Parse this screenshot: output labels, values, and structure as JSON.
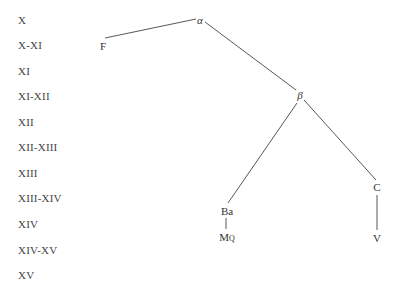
{
  "timeline": {
    "labels": [
      "X",
      "X-XI",
      "XI",
      "XI-XII",
      "XII",
      "XII-XIII",
      "XIII",
      "XIII-XIV",
      "XIV",
      "XIV-XV",
      "XV"
    ]
  },
  "stemma": {
    "nodes": {
      "alpha": {
        "label": "α"
      },
      "beta": {
        "label": "β"
      },
      "F": {
        "label": "F"
      },
      "Ba": {
        "label": "Ba"
      },
      "MQ": {
        "label_main": "M",
        "label_sub": "Q"
      },
      "C": {
        "label": "C"
      },
      "V": {
        "label": "V"
      }
    },
    "edges": [
      [
        "alpha",
        "F"
      ],
      [
        "alpha",
        "beta"
      ],
      [
        "beta",
        "Ba"
      ],
      [
        "beta",
        "C"
      ],
      [
        "Ba",
        "MQ"
      ],
      [
        "C",
        "V"
      ]
    ]
  },
  "colors": {
    "line": "#444444",
    "text": "#3a3a3a"
  }
}
